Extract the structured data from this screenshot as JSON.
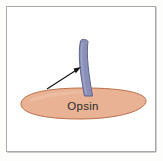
{
  "figure": {
    "kind": "biology-schematic-diagram",
    "canvas": {
      "width": 163,
      "height": 161,
      "background": "#fdfdfc"
    },
    "frame": {
      "name": "figure-border",
      "x": 6,
      "y": 6,
      "width": 150,
      "height": 146,
      "fill": "#ffffff",
      "stroke": "#a8a8a8",
      "stroke_width": 1
    },
    "shapes": {
      "opsin_body": {
        "label": "Opsin",
        "role": "membrane-protein-body",
        "fill": "#e9b294",
        "stroke": "#b9704a",
        "stroke_width": 1,
        "center_x": 83,
        "center_y": 103,
        "radius_x": 63,
        "radius_y": 16
      },
      "retinal_rod": {
        "label": "",
        "role": "retinal-chromophore-rod",
        "fill": "#8b90b8",
        "stroke": "#5f648f",
        "stroke_width": 1,
        "top_x": 82,
        "top_y": 40,
        "bottom_x": 88,
        "bottom_y": 97,
        "thickness": 9
      },
      "pointer_arrow": {
        "role": "annotation-arrow",
        "color": "#111111",
        "stroke_width": 1,
        "tail_x": 47,
        "tail_y": 89,
        "tip_x": 81,
        "tip_y": 67
      }
    },
    "labels": {
      "opsin": {
        "text": "Opsin",
        "x": 83,
        "y": 107,
        "color": "#2b2b2b",
        "font_size": 11.5
      }
    }
  }
}
